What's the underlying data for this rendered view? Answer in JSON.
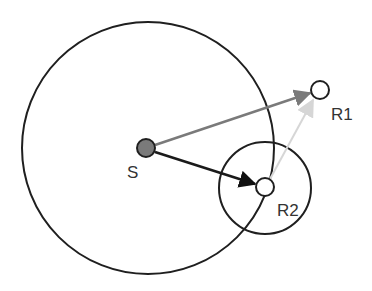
{
  "diagram": {
    "nodes": {
      "S": {
        "label": "S",
        "x": 146,
        "y": 148,
        "r": 9,
        "fill": "#7a7a7a",
        "label_x": 127,
        "label_y": 178
      },
      "R1": {
        "label": "R1",
        "x": 320,
        "y": 90,
        "r": 9,
        "fill": "#ffffff",
        "label_x": 331,
        "label_y": 120
      },
      "R2": {
        "label": "R2",
        "x": 265,
        "y": 187,
        "r": 9,
        "fill": "#ffffff",
        "label_x": 277,
        "label_y": 216
      }
    },
    "ranges": [
      {
        "name": "S-range",
        "cx": 148,
        "cy": 148,
        "r": 126
      },
      {
        "name": "R2-range",
        "cx": 265,
        "cy": 188,
        "r": 46
      }
    ],
    "edges": [
      {
        "from": "S",
        "to": "R1",
        "color": "#808080",
        "style": "solid"
      },
      {
        "from": "S",
        "to": "R2",
        "color": "#1a1a1a",
        "style": "solid"
      },
      {
        "from": "R2",
        "to": "R1",
        "color": "#d0d0d0",
        "style": "faint"
      }
    ],
    "colors": {
      "stroke": "#1f1f1f",
      "background": "#ffffff"
    }
  }
}
